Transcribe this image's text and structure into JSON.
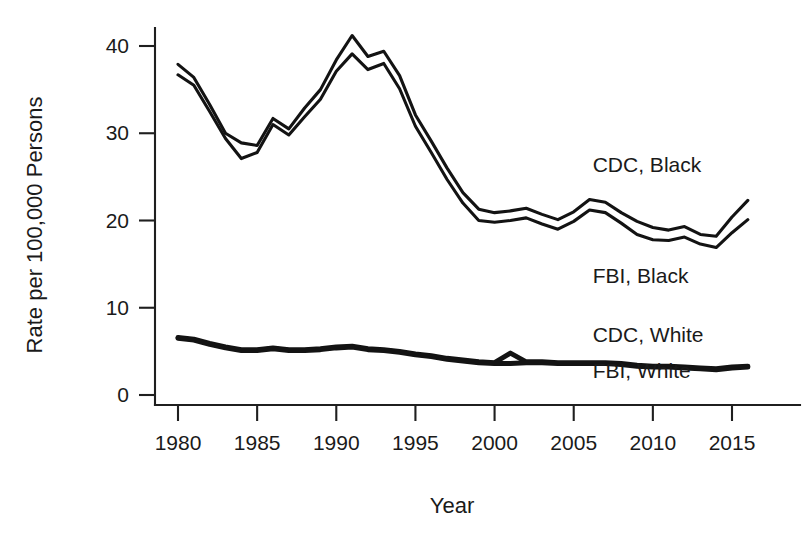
{
  "chart_data": {
    "type": "line",
    "title": "",
    "xlabel": "Year",
    "ylabel": "Rate per 100,000 Persons",
    "xlim": [
      1979,
      2016.6
    ],
    "ylim": [
      0,
      43
    ],
    "xticks": [
      1980,
      1985,
      1990,
      1995,
      2000,
      2005,
      2010,
      2015
    ],
    "xtick_labels": [
      "1980",
      "1985",
      "1990",
      "1995",
      "2000",
      "2005",
      "2010",
      "2015"
    ],
    "yticks": [
      0,
      10,
      20,
      30,
      40
    ],
    "ytick_labels": [
      "0",
      "10",
      "20",
      "30",
      "40"
    ],
    "grid": false,
    "legend_position": "inline-right",
    "line_color": "#131313",
    "x": [
      1980,
      1981,
      1982,
      1983,
      1984,
      1985,
      1986,
      1987,
      1988,
      1989,
      1990,
      1991,
      1992,
      1993,
      1994,
      1995,
      1996,
      1997,
      1998,
      1999,
      2000,
      2001,
      2002,
      2003,
      2004,
      2005,
      2006,
      2007,
      2008,
      2009,
      2010,
      2011,
      2012,
      2013,
      2014,
      2015,
      2016
    ],
    "series": [
      {
        "name": "CDC, Black",
        "label": "CDC, Black",
        "style": "thin",
        "label_x": 2006.2,
        "label_y": 25.6,
        "values": [
          37.9,
          36.4,
          33.3,
          30.0,
          28.9,
          28.6,
          31.7,
          30.5,
          32.9,
          35.0,
          38.4,
          41.2,
          38.8,
          39.4,
          36.6,
          32.1,
          29.1,
          26.0,
          23.2,
          21.3,
          20.9,
          21.1,
          21.4,
          20.7,
          20.1,
          21.0,
          22.4,
          22.1,
          20.9,
          19.9,
          19.2,
          18.9,
          19.3,
          18.4,
          18.2,
          20.4,
          22.3
        ]
      },
      {
        "name": "FBI, Black",
        "label": "FBI, Black",
        "style": "thin",
        "label_x": 2006.2,
        "label_y": 12.8,
        "values": [
          36.7,
          35.5,
          32.5,
          29.4,
          27.1,
          27.8,
          31.0,
          29.8,
          31.9,
          33.9,
          37.1,
          39.1,
          37.3,
          38.0,
          35.1,
          30.8,
          27.8,
          24.7,
          22.0,
          20.0,
          19.8,
          20.0,
          20.3,
          19.6,
          19.0,
          19.9,
          21.2,
          20.9,
          19.7,
          18.4,
          17.8,
          17.7,
          18.1,
          17.3,
          16.9,
          18.6,
          20.1
        ]
      },
      {
        "name": "CDC, White",
        "label": "CDC, White",
        "style": "thick",
        "label_x": 2006.2,
        "label_y": 6.1,
        "values": [
          6.6,
          6.4,
          5.9,
          5.5,
          5.2,
          5.2,
          5.4,
          5.2,
          5.2,
          5.3,
          5.5,
          5.6,
          5.3,
          5.2,
          5.0,
          4.7,
          4.5,
          4.2,
          4.0,
          3.8,
          3.7,
          4.8,
          3.8,
          3.8,
          3.7,
          3.7,
          3.7,
          3.7,
          3.6,
          3.4,
          3.3,
          3.3,
          3.2,
          3.1,
          3.0,
          3.2,
          3.3
        ]
      },
      {
        "name": "FBI, White",
        "label": "FBI, White",
        "style": "thick",
        "label_x": 2006.2,
        "label_y": 2.0,
        "values": [
          6.5,
          6.3,
          5.8,
          5.4,
          5.1,
          5.1,
          5.3,
          5.1,
          5.1,
          5.2,
          5.4,
          5.5,
          5.2,
          5.1,
          4.9,
          4.6,
          4.4,
          4.1,
          3.9,
          3.7,
          3.6,
          3.6,
          3.7,
          3.7,
          3.6,
          3.6,
          3.6,
          3.6,
          3.5,
          3.3,
          3.2,
          3.2,
          3.1,
          3.0,
          2.9,
          3.1,
          3.2
        ]
      }
    ]
  }
}
